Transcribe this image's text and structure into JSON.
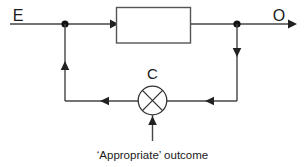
{
  "diagram": {
    "type": "feedback-block-diagram",
    "background_color": "#ffffff",
    "line_color": "#444444",
    "text_color": "#1a1a1a",
    "labels": {
      "input": "E",
      "output": "O",
      "junction": "C",
      "caption": "‘Appropriate’ outcome"
    },
    "nodes": {
      "input_tap_label": "input-branch-node",
      "output_tap_label": "output-branch-node"
    },
    "process_block": {
      "content": ""
    }
  }
}
